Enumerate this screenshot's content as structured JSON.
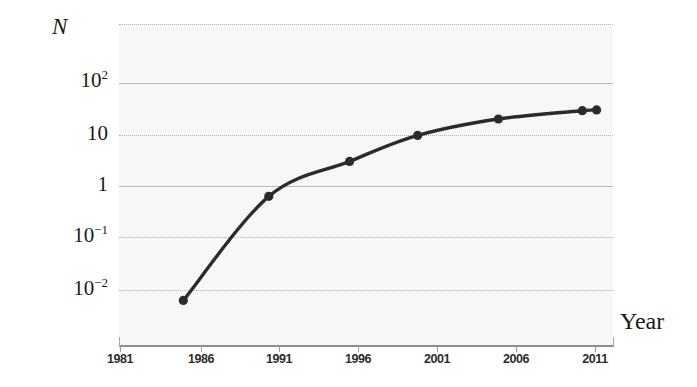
{
  "chart_data": {
    "type": "line",
    "title": "",
    "subtitle": "",
    "xlabel": "Year",
    "ylabel": "N",
    "yscale": "log",
    "xscale": "linear",
    "grid": true,
    "legend": "none",
    "xlim": [
      1981,
      2012.1
    ],
    "ylim": [
      0.0045,
      1400
    ],
    "xticks": [
      1981,
      1986,
      1991,
      1996,
      2001,
      2006,
      2011
    ],
    "xtick_labels": [
      "1981",
      "1986",
      "1991",
      "1996",
      "2001",
      "2006",
      "2011"
    ],
    "yticks": [
      100,
      10,
      1,
      0.1,
      0.01
    ],
    "ytick_labels": [
      "10²",
      "10",
      "1",
      "10⁻¹",
      "10⁻²"
    ],
    "ytick_label_parts": [
      {
        "base": "10",
        "exp": "2"
      },
      {
        "base": "10",
        "exp": ""
      },
      {
        "base": "1",
        "exp": ""
      },
      {
        "base": "10",
        "exp": "−1"
      },
      {
        "base": "10",
        "exp": "−2"
      }
    ],
    "series": [
      {
        "name": "N",
        "marker": "filled-circle",
        "color": "#2b2b2b",
        "x": [
          1985.0,
          1990.4,
          1995.5,
          1999.8,
          2004.9,
          2010.2,
          2011.1
        ],
        "y": [
          0.006,
          0.63,
          3.0,
          9.6,
          20.0,
          29.0,
          30.0
        ],
        "point_labels": [
          "",
          "",
          "",
          "",
          "",
          "",
          ""
        ]
      }
    ],
    "annotations": []
  },
  "figure": {
    "background_color": "#ffffff",
    "plot_background_color": "#f7f7f7",
    "gridline_color": "#b9b9b9",
    "axis_color": "#8d8d8d",
    "series_color": "#2b2b2b",
    "text_color": "#1a1a1a"
  },
  "axis_titles": {
    "y": "N",
    "x": "Year"
  }
}
